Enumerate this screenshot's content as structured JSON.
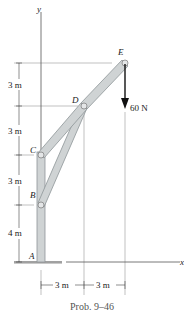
{
  "figure": {
    "caption": "Prob. 9–46",
    "axes": {
      "y_label": "y",
      "x_label": "x"
    },
    "points": {
      "A": "A",
      "B": "B",
      "C": "C",
      "D": "D",
      "E": "E"
    },
    "load": {
      "label": "60 N",
      "direction": "down",
      "at": "E"
    },
    "vertical_dims": [
      "3 m",
      "3 m",
      "3 m",
      "4 m"
    ],
    "horizontal_dims": [
      "3 m",
      "3 m"
    ],
    "colors": {
      "member_fill": "#cfd3d4",
      "member_stroke": "#8e9598",
      "line": "#555555",
      "arrow": "#111111"
    }
  }
}
